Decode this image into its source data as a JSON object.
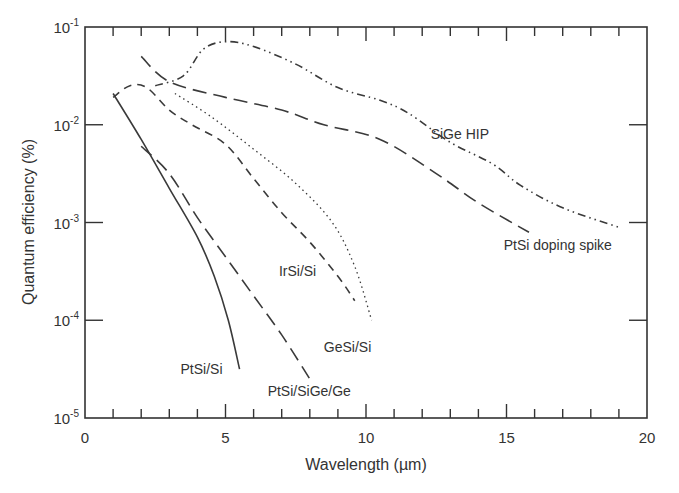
{
  "chart_data": {
    "type": "line",
    "title": "",
    "xlabel": "Wavelength (µm)",
    "ylabel": "Quantum efficiency (%)",
    "xlim": [
      0,
      20
    ],
    "ylim": [
      1e-05,
      0.1
    ],
    "yscale": "log",
    "grid": false,
    "legend": "inline labels",
    "x_ticks": [
      "0",
      "5",
      "10",
      "15",
      "20"
    ],
    "y_ticks": [
      {
        "base": "10",
        "exp": "-1"
      },
      {
        "base": "10",
        "exp": "-2"
      },
      {
        "base": "10",
        "exp": "-3"
      },
      {
        "base": "10",
        "exp": "-4"
      },
      {
        "base": "10",
        "exp": "-5"
      }
    ],
    "series": [
      {
        "name": "PtSi/Si",
        "style": "solid",
        "label_pos": [
          3.4,
          -4.55
        ],
        "points": [
          [
            1.0,
            -1.68
          ],
          [
            2.0,
            -2.15
          ],
          [
            3.0,
            -2.65
          ],
          [
            4.0,
            -3.15
          ],
          [
            4.6,
            -3.55
          ],
          [
            5.1,
            -4.0
          ],
          [
            5.5,
            -4.5
          ]
        ]
      },
      {
        "name": "PtSi/SiGe/Ge",
        "style": "longdash",
        "label_pos": [
          6.5,
          -4.78
        ],
        "points": [
          [
            2.0,
            -2.22
          ],
          [
            3.0,
            -2.5
          ],
          [
            4.0,
            -2.95
          ],
          [
            5.0,
            -3.35
          ],
          [
            6.0,
            -3.75
          ],
          [
            7.0,
            -4.15
          ],
          [
            8.0,
            -4.6
          ]
        ]
      },
      {
        "name": "IrSi/Si",
        "style": "dash",
        "label_pos": [
          6.9,
          -3.55
        ],
        "points": [
          [
            1.0,
            -1.72
          ],
          [
            1.6,
            -1.6
          ],
          [
            2.2,
            -1.62
          ],
          [
            3.0,
            -1.85
          ],
          [
            3.8,
            -2.0
          ],
          [
            5.0,
            -2.2
          ],
          [
            6.0,
            -2.55
          ],
          [
            7.0,
            -2.9
          ],
          [
            8.0,
            -3.2
          ],
          [
            9.0,
            -3.55
          ],
          [
            9.6,
            -3.8
          ]
        ]
      },
      {
        "name": "GeSi/Si",
        "style": "dotted",
        "label_pos": [
          8.5,
          -4.32
        ],
        "points": [
          [
            3.2,
            -1.68
          ],
          [
            4.5,
            -1.92
          ],
          [
            6.0,
            -2.25
          ],
          [
            7.5,
            -2.6
          ],
          [
            8.8,
            -3.0
          ],
          [
            9.6,
            -3.45
          ],
          [
            10.2,
            -4.0
          ]
        ]
      },
      {
        "name": "PtSi doping spike",
        "style": "longdash",
        "label_pos": [
          14.9,
          -3.28
        ],
        "points": [
          [
            2.0,
            -1.3
          ],
          [
            3.0,
            -1.56
          ],
          [
            5.0,
            -1.72
          ],
          [
            7.0,
            -1.85
          ],
          [
            8.5,
            -2.0
          ],
          [
            10.5,
            -2.15
          ],
          [
            12.5,
            -2.5
          ],
          [
            14.0,
            -2.8
          ],
          [
            15.8,
            -3.1
          ]
        ]
      },
      {
        "name": "SiGe HIP",
        "style": "dashdotdot",
        "label_pos": [
          12.3,
          -2.15
        ],
        "points": [
          [
            2.5,
            -1.6
          ],
          [
            3.5,
            -1.5
          ],
          [
            4.2,
            -1.23
          ],
          [
            5.0,
            -1.15
          ],
          [
            6.0,
            -1.2
          ],
          [
            7.5,
            -1.38
          ],
          [
            9.0,
            -1.62
          ],
          [
            10.5,
            -1.75
          ],
          [
            11.5,
            -1.88
          ],
          [
            13.0,
            -2.18
          ],
          [
            14.5,
            -2.4
          ],
          [
            15.5,
            -2.62
          ],
          [
            17.0,
            -2.85
          ],
          [
            19.0,
            -3.05
          ]
        ]
      }
    ]
  }
}
